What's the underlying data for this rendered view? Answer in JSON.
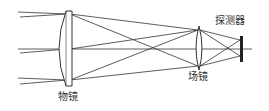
{
  "diagram": {
    "labels": {
      "objective": "物镜",
      "field_lens": "场镜",
      "detector": "探测器"
    },
    "colors": {
      "line": "#333333",
      "background": "#ffffff"
    }
  }
}
